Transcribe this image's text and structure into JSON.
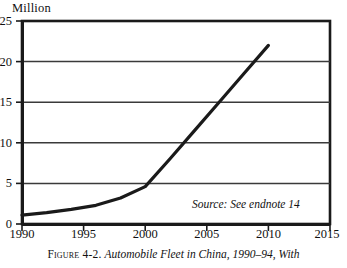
{
  "figure": {
    "caption_prefix": "Figure 4-2.",
    "caption_title": "Automobile Fleet in China, 1990–94, With",
    "source_note": "Source: See endnote 14"
  },
  "colors": {
    "line": "#1a1a1a",
    "frame": "#1a1a1a",
    "grid": "#3a3a3a",
    "background": "#ffffff",
    "text": "#111111"
  },
  "chart_data": {
    "type": "line",
    "title": "Automobile Fleet in China, 1990–94, With",
    "unit_label": "Million",
    "xlabel": "",
    "ylabel": "Million",
    "xlim": [
      1990,
      2015
    ],
    "ylim": [
      0,
      25
    ],
    "grid": true,
    "legend": "none",
    "xticks": [
      1990,
      1995,
      2000,
      2005,
      2010,
      2015
    ],
    "xtick_labels": [
      "1990",
      "1995",
      "2000",
      "2005",
      "2010",
      "2015"
    ],
    "yticks": [
      0,
      5,
      10,
      15,
      20,
      25
    ],
    "ytick_labels": [
      "0",
      "5",
      "10",
      "15",
      "20",
      "25"
    ],
    "series": [
      {
        "name": "Automobile fleet in China",
        "x": [
          1990,
          1992,
          1994,
          1996,
          1998,
          2000,
          2002,
          2004,
          2006,
          2008,
          2010
        ],
        "values": [
          1.1,
          1.4,
          1.8,
          2.3,
          3.2,
          4.6,
          8.0,
          11.5,
          15.0,
          18.5,
          22.0
        ]
      }
    ],
    "annotations": [
      {
        "text": "Source: See endnote 14",
        "x": 2006,
        "y": 2.2,
        "style": "italic"
      }
    ]
  }
}
